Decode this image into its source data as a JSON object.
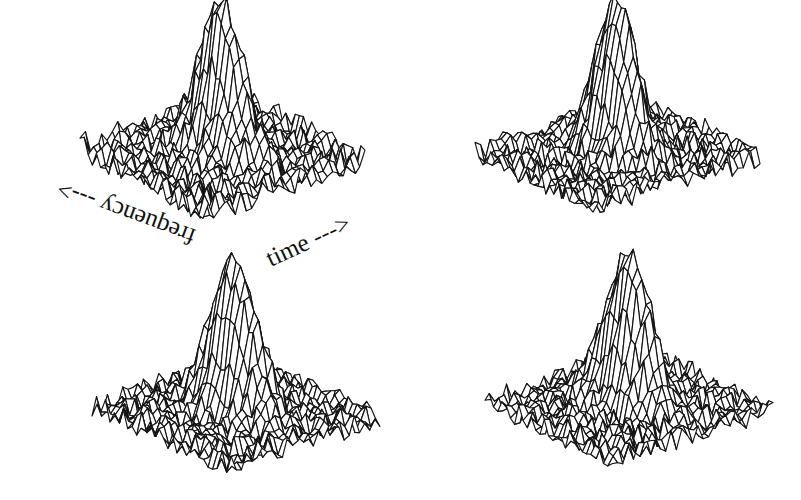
{
  "figure": {
    "background": "#ffffff",
    "line_color": "#141414"
  },
  "labels": {
    "frequency": "frequency --->",
    "time": "time --->"
  },
  "chart_data": {
    "type": "surface-wireframe",
    "title": "",
    "xlabel": "time",
    "ylabel": "frequency",
    "zlabel": "",
    "grid_size": [
      30,
      30
    ],
    "panels": [
      {
        "id": "top-left",
        "peak_height": 1.0,
        "peak_center": [
          0.5,
          0.5
        ],
        "peak_width": [
          0.07,
          0.16
        ],
        "noise_level": 0.09,
        "seed": 11,
        "corners": {
          "left": [
            80,
            160
          ],
          "front": [
            203,
            225
          ],
          "right": [
            365,
            175
          ]
        },
        "z_scale": 150,
        "show_axis_labels": true
      },
      {
        "id": "top-right",
        "peak_height": 1.0,
        "peak_center": [
          0.5,
          0.5
        ],
        "peak_width": [
          0.07,
          0.16
        ],
        "noise_level": 0.08,
        "seed": 23,
        "corners": {
          "left": [
            475,
            163
          ],
          "front": [
            593,
            218
          ],
          "right": [
            760,
            168
          ]
        },
        "z_scale": 150,
        "show_axis_labels": false
      },
      {
        "id": "bottom-left",
        "peak_height": 1.0,
        "peak_center": [
          0.5,
          0.5
        ],
        "peak_width": [
          0.07,
          0.17
        ],
        "noise_level": 0.08,
        "seed": 37,
        "corners": {
          "left": [
            92,
            418
          ],
          "front": [
            226,
            476
          ],
          "right": [
            380,
            430
          ]
        },
        "z_scale": 150,
        "show_axis_labels": false
      },
      {
        "id": "bottom-right",
        "peak_height": 1.0,
        "peak_center": [
          0.5,
          0.5
        ],
        "peak_width": [
          0.07,
          0.17
        ],
        "noise_level": 0.08,
        "seed": 53,
        "corners": {
          "left": [
            485,
            412
          ],
          "front": [
            612,
            470
          ],
          "right": [
            773,
            422
          ]
        },
        "z_scale": 150,
        "show_axis_labels": false
      }
    ],
    "annotations": [
      {
        "text": "frequency --->",
        "rotation_deg": 200,
        "position": "below-left of top-left plot"
      },
      {
        "text": "time --->",
        "rotation_deg": -25,
        "position": "below-right of top-left plot"
      }
    ],
    "grid": false,
    "legend": null
  }
}
